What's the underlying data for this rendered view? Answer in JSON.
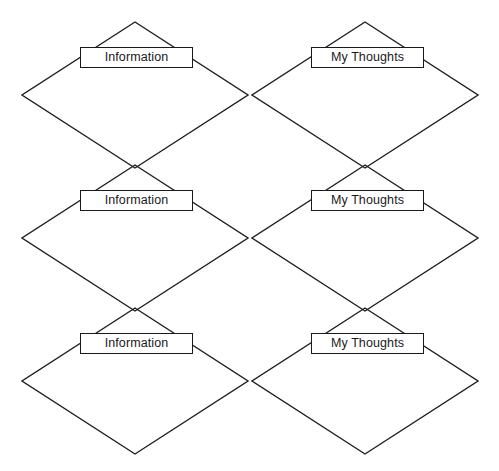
{
  "document": {
    "title": "Information / My Thoughts double-diamond graphic organizer",
    "background_color": "#ffffff",
    "line_color": "#231f20",
    "text_color": "#1a1a1a",
    "width": 499,
    "height": 471
  },
  "diagram": {
    "type": "graphic-organizer",
    "rows": 3,
    "columns": 2,
    "column_labels": [
      "Information",
      "My Thoughts"
    ],
    "cells": [
      {
        "row": 1,
        "column": 1,
        "label": "Information",
        "diamond": {
          "cx": 135,
          "cy": 95,
          "half_width": 113,
          "half_height": 73
        },
        "label_box": {
          "x": 80,
          "y": 47,
          "width": 113,
          "height": 21
        }
      },
      {
        "row": 1,
        "column": 2,
        "label": "My Thoughts",
        "diamond": {
          "cx": 365,
          "cy": 95,
          "half_width": 113,
          "half_height": 73
        },
        "label_box": {
          "x": 311,
          "y": 47,
          "width": 113,
          "height": 21
        }
      },
      {
        "row": 2,
        "column": 1,
        "label": "Information",
        "diamond": {
          "cx": 135,
          "cy": 238,
          "half_width": 113,
          "half_height": 73
        },
        "label_box": {
          "x": 80,
          "y": 190,
          "width": 113,
          "height": 21
        }
      },
      {
        "row": 2,
        "column": 2,
        "label": "My Thoughts",
        "diamond": {
          "cx": 365,
          "cy": 238,
          "half_width": 113,
          "half_height": 73
        },
        "label_box": {
          "x": 311,
          "y": 190,
          "width": 113,
          "height": 21
        }
      },
      {
        "row": 3,
        "column": 1,
        "label": "Information",
        "diamond": {
          "cx": 135,
          "cy": 381,
          "half_width": 113,
          "half_height": 73
        },
        "label_box": {
          "x": 80,
          "y": 333,
          "width": 113,
          "height": 21
        }
      },
      {
        "row": 3,
        "column": 2,
        "label": "My Thoughts",
        "diamond": {
          "cx": 365,
          "cy": 381,
          "half_width": 113,
          "half_height": 73
        },
        "label_box": {
          "x": 311,
          "y": 333,
          "width": 113,
          "height": 21
        }
      }
    ]
  }
}
